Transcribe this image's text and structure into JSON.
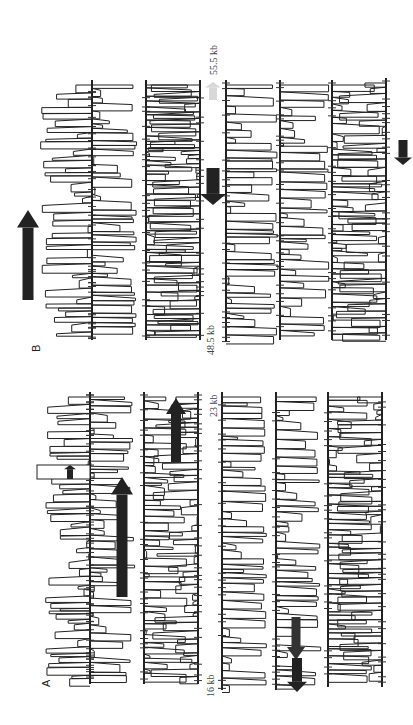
{
  "figure": {
    "orientation": "rotated 90 degrees counter-clockwise",
    "panels": [
      {
        "id": "B",
        "label": "B",
        "start_label": "48.5 kb",
        "end_label": "55.5 kb",
        "tracks": 6,
        "arrows": [
          {
            "color": "#222222",
            "direction": "up",
            "size": "large",
            "position": "upper-left"
          },
          {
            "color": "#222222",
            "direction": "down",
            "size": "large",
            "position": "center"
          },
          {
            "color": "#d8d8d8",
            "direction": "up",
            "size": "small",
            "position": "center-top"
          },
          {
            "color": "#222222",
            "direction": "down",
            "size": "small",
            "position": "right"
          }
        ]
      },
      {
        "id": "A",
        "label": "A",
        "start_label": "16 kb",
        "end_label": "23 kb",
        "tracks": 6,
        "arrows": [
          {
            "color": "#222222",
            "direction": "up",
            "size": "large",
            "position": "left-middle"
          },
          {
            "color": "#222222",
            "direction": "up",
            "size": "medium",
            "position": "left-top"
          },
          {
            "color": "#222222",
            "direction": "up",
            "size": "small",
            "position": "boxed-left"
          },
          {
            "color": "#333333",
            "direction": "down",
            "size": "medium",
            "position": "right-bottom"
          },
          {
            "color": "#222222",
            "direction": "down",
            "size": "small",
            "position": "right-bottom-center"
          }
        ]
      }
    ]
  }
}
